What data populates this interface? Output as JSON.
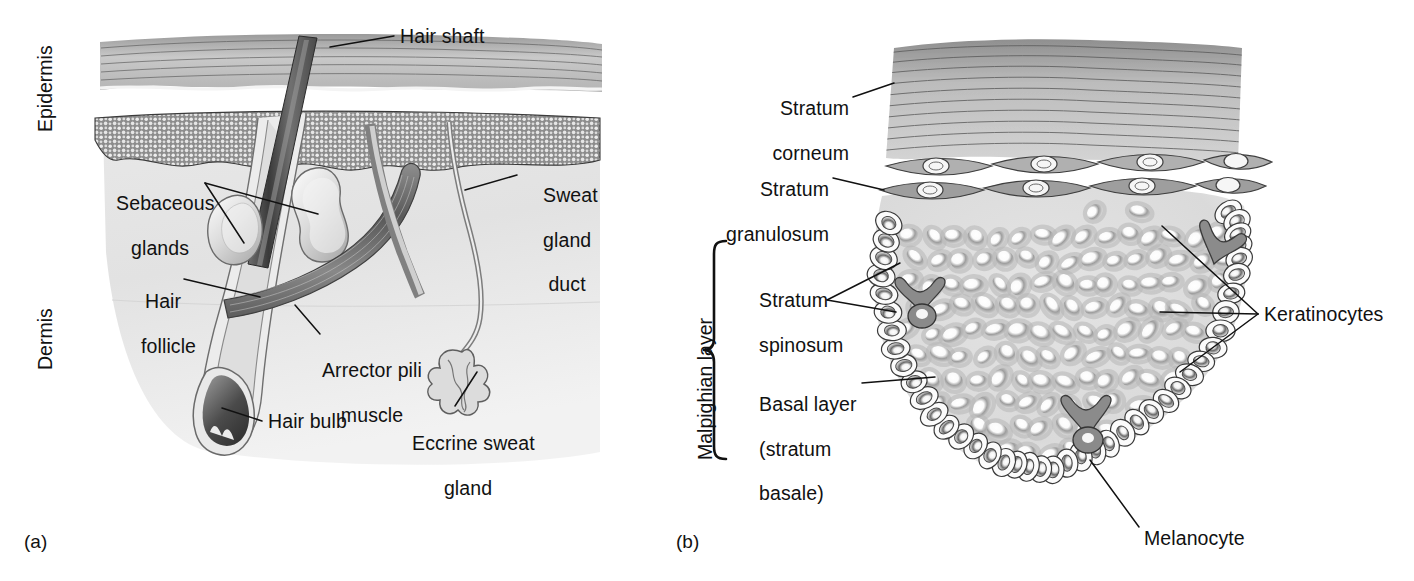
{
  "figure": {
    "ink_color": "#111111",
    "background": "#ffffff"
  },
  "panel_a": {
    "caption": "(a)",
    "subject": "cross-section of skin showing hair follicle, sebaceous glands and sweat gland",
    "region_labels": [
      {
        "name": "epidermis",
        "text": "Epidermis"
      },
      {
        "name": "dermis",
        "text": "Dermis"
      }
    ],
    "labels": [
      {
        "name": "hair-shaft",
        "text": "Hair shaft"
      },
      {
        "name": "sebaceous-glands",
        "line1": "Sebaceous",
        "line2": "glands"
      },
      {
        "name": "hair-follicle",
        "line1": "Hair",
        "line2": "follicle"
      },
      {
        "name": "sweat-gland-duct",
        "line1": "Sweat",
        "line2": "gland",
        "line3": "duct"
      },
      {
        "name": "arrector-pili-muscle",
        "line1": "Arrector pili",
        "line2": "muscle"
      },
      {
        "name": "hair-bulb",
        "text": "Hair bulb"
      },
      {
        "name": "eccrine-sweat-gland",
        "line1": "Eccrine sweat",
        "line2": "gland"
      }
    ]
  },
  "panel_b": {
    "caption": "(b)",
    "subject": "magnified view of the epidermal layers",
    "bracket_label": {
      "name": "malpighian-layer",
      "text": "Malpighian layer"
    },
    "labels": [
      {
        "name": "stratum-corneum",
        "line1": "Stratum",
        "line2": "corneum"
      },
      {
        "name": "stratum-granulosum",
        "line1": "Stratum",
        "line2": "granulosum"
      },
      {
        "name": "stratum-spinosum",
        "line1": "Stratum",
        "line2": "spinosum"
      },
      {
        "name": "basal-layer",
        "line1": "Basal layer",
        "line2": "(stratum",
        "line3": "basale)"
      },
      {
        "name": "keratinocytes",
        "text": "Keratinocytes"
      },
      {
        "name": "melanocyte",
        "text": "Melanocyte"
      }
    ]
  }
}
